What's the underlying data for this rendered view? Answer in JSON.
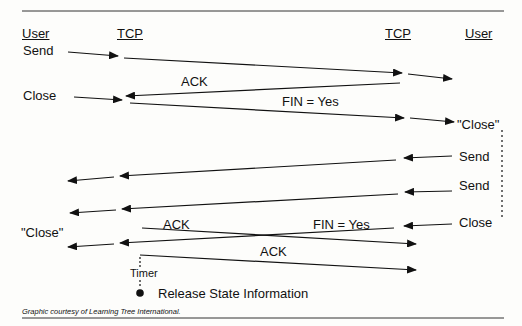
{
  "headers": {
    "left_user": "User",
    "left_tcp": "TCP",
    "right_tcp": "TCP",
    "right_user": "User"
  },
  "labels": {
    "send_left": "Send",
    "close_left": "Close",
    "ack_1": "ACK",
    "fin_1": "FIN = Yes",
    "close_quoted_right": "\"Close\"",
    "send_right_1": "Send",
    "send_right_2": "Send",
    "close_right": "Close",
    "close_quoted_left": "\"Close\"",
    "ack_2": "ACK",
    "fin_2": "FIN = Yes",
    "ack_3": "ACK",
    "timer": "Timer",
    "release": "Release State Information"
  },
  "credit": "Graphic courtesy of Learning Tree International.",
  "colors": {
    "line": "#111111",
    "background": "#fdfdfb"
  }
}
